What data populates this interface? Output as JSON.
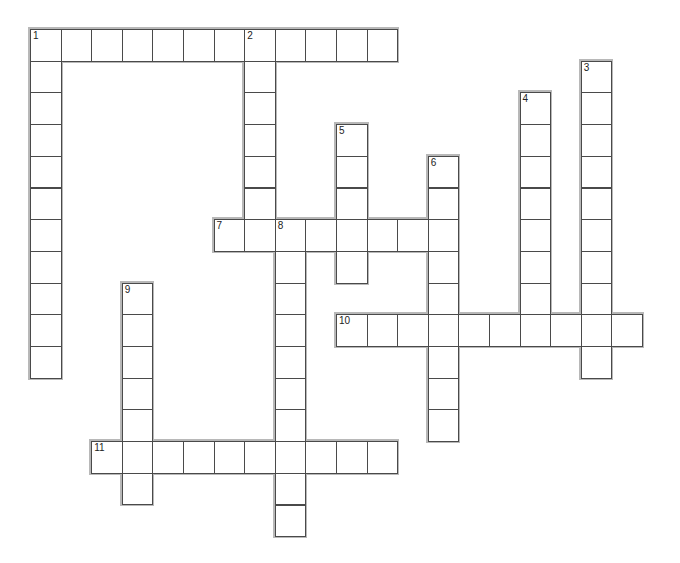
{
  "puzzle": {
    "cell_width": 30.6,
    "cell_height": 31.7,
    "origin_x": 30,
    "origin_y": 29,
    "colors": {
      "cell_border": "#4a4a4a",
      "word_outline": "#b8b8b8",
      "background": "#ffffff"
    },
    "words": [
      {
        "number": "1",
        "direction": "across",
        "row": 0,
        "col": 0,
        "length": 12
      },
      {
        "number": "1",
        "direction": "down",
        "row": 0,
        "col": 0,
        "length": 11
      },
      {
        "number": "2",
        "direction": "down",
        "row": 0,
        "col": 7,
        "length": 7
      },
      {
        "number": "3",
        "direction": "down",
        "row": 1,
        "col": 18,
        "length": 10
      },
      {
        "number": "4",
        "direction": "down",
        "row": 2,
        "col": 16,
        "length": 8
      },
      {
        "number": "5",
        "direction": "down",
        "row": 3,
        "col": 10,
        "length": 5
      },
      {
        "number": "6",
        "direction": "down",
        "row": 4,
        "col": 13,
        "length": 9
      },
      {
        "number": "7",
        "direction": "across",
        "row": 6,
        "col": 6,
        "length": 8
      },
      {
        "number": "8",
        "direction": "down",
        "row": 6,
        "col": 8,
        "length": 10
      },
      {
        "number": "9",
        "direction": "down",
        "row": 8,
        "col": 3,
        "length": 7
      },
      {
        "number": "10",
        "direction": "across",
        "row": 9,
        "col": 10,
        "length": 10
      },
      {
        "number": "11",
        "direction": "across",
        "row": 13,
        "col": 2,
        "length": 10
      }
    ]
  }
}
